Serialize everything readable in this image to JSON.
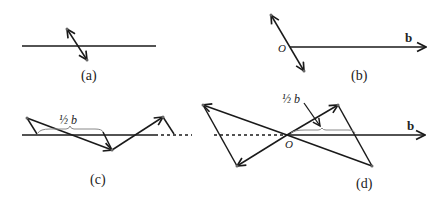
{
  "panels": {
    "a": {
      "caption": "(a)"
    },
    "b": {
      "caption": "(b)",
      "origin_label": "O",
      "vector_label": "b"
    },
    "c": {
      "caption": "(c)",
      "half_b_label": "½ b"
    },
    "d": {
      "caption": "(d)",
      "origin_label": "O",
      "vector_label": "b",
      "half_b_label": "½ b"
    }
  },
  "colors": {
    "stroke": "#1a1a1a",
    "point": "#666666",
    "brace": "#888888"
  }
}
